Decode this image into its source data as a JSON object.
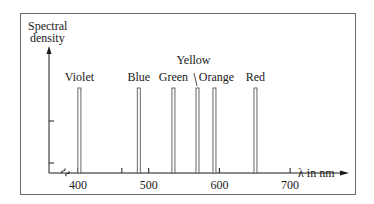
{
  "figure": {
    "y_axis_label_line1": "Spectral",
    "y_axis_label_line2": "density",
    "x_axis_label": "λ in nm",
    "break_symbol": "≈"
  },
  "chart_data": {
    "type": "bar",
    "title": "",
    "xlabel": "λ in nm",
    "ylabel": "Spectral density",
    "x_ticks": [
      400,
      500,
      600,
      700
    ],
    "xlim": [
      360,
      720
    ],
    "axis_break_at_origin": true,
    "lines": [
      {
        "label": "Violet",
        "wavelength_nm": 402
      },
      {
        "label": "Blue",
        "wavelength_nm": 486
      },
      {
        "label": "Green",
        "wavelength_nm": 535
      },
      {
        "label": "Yellow",
        "wavelength_nm": 569
      },
      {
        "label": "Orange",
        "wavelength_nm": 593
      },
      {
        "label": "Red",
        "wavelength_nm": 651
      }
    ],
    "categories": [
      "Violet",
      "Blue",
      "Green",
      "Yellow",
      "Orange",
      "Red"
    ],
    "values": [
      1,
      1,
      1,
      1,
      1,
      1
    ],
    "grid": false,
    "legend": "none"
  }
}
